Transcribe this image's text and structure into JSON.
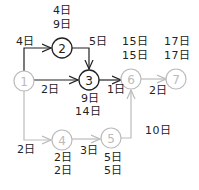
{
  "colors": {
    "active": "#222222",
    "inactive": "#bbbbbb"
  },
  "nodes": [
    {
      "id": "1",
      "x": 24,
      "y": 81,
      "active": false
    },
    {
      "id": "2",
      "x": 62,
      "y": 48,
      "active": true
    },
    {
      "id": "3",
      "x": 89,
      "y": 80,
      "active": true
    },
    {
      "id": "4",
      "x": 62,
      "y": 140,
      "active": false
    },
    {
      "id": "5",
      "x": 111,
      "y": 138,
      "active": false
    },
    {
      "id": "6",
      "x": 131,
      "y": 79,
      "active": false
    },
    {
      "id": "7",
      "x": 176,
      "y": 79,
      "active": false
    }
  ],
  "edges": [
    {
      "from": "1",
      "to": "2",
      "duration": "4日"
    },
    {
      "from": "2",
      "to": "3",
      "duration": "5日"
    },
    {
      "from": "1",
      "to": "3",
      "duration": "2日"
    },
    {
      "from": "3",
      "to": "6",
      "duration": "1日"
    },
    {
      "from": "6",
      "to": "7",
      "duration": "2日"
    },
    {
      "from": "1",
      "to": "4",
      "duration": "2日"
    },
    {
      "from": "4",
      "to": "5",
      "duration": "3日"
    },
    {
      "from": "5",
      "to": "6",
      "duration": "10日"
    }
  ],
  "node_times": {
    "2": {
      "earliest": "4日",
      "latest": "9日"
    },
    "3": {
      "earliest": "9日",
      "latest": "14日"
    },
    "4": {
      "earliest": "2日",
      "latest": "2日"
    },
    "5": {
      "earliest": "5日",
      "latest": "5日"
    },
    "6": {
      "earliest": "15日",
      "latest": "15日"
    },
    "7": {
      "earliest": "17日",
      "latest": "17日"
    }
  }
}
